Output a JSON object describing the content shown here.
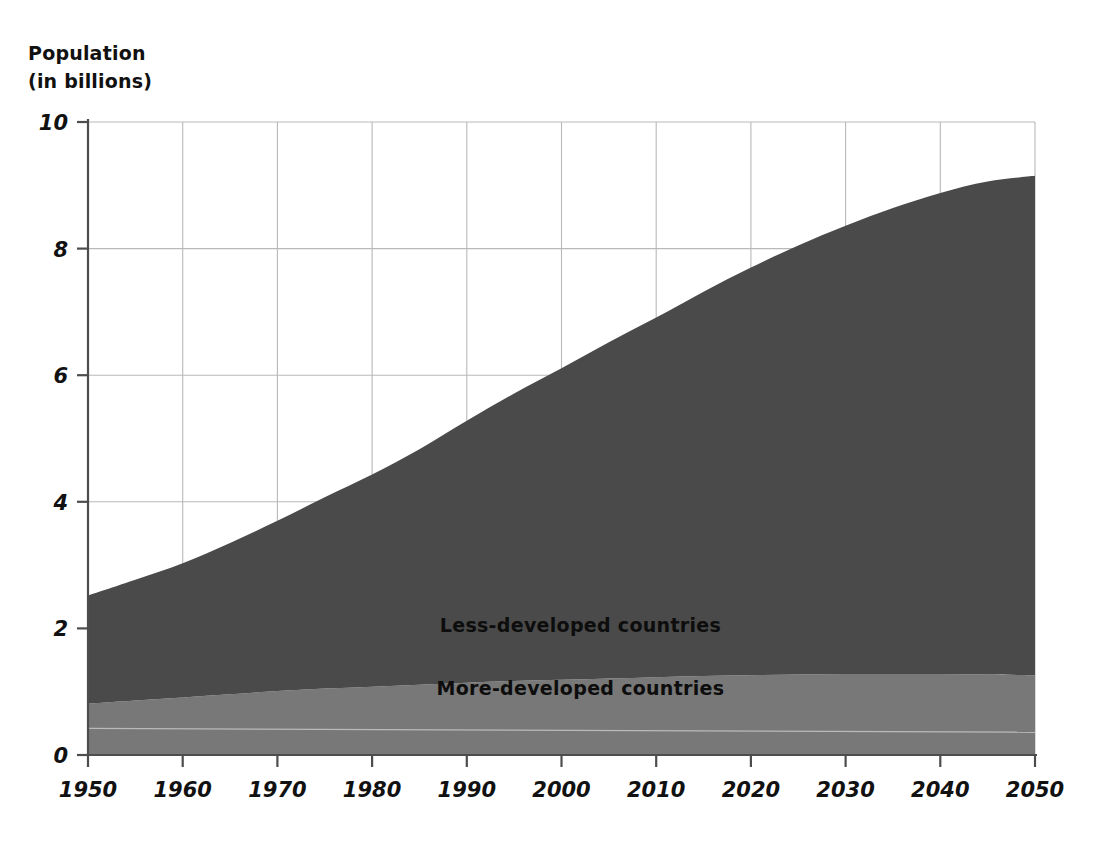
{
  "chart_data": {
    "type": "area",
    "title": "",
    "subtitle": "",
    "ylabel_line1": "Population",
    "ylabel_line2": "(in billions)",
    "xlabel": "",
    "stacked": true,
    "grid": true,
    "legend_position": "inline-on-areas",
    "xlim": [
      1950,
      2050
    ],
    "ylim": [
      0,
      10
    ],
    "yticks": [
      "0",
      "2",
      "4",
      "6",
      "8",
      "10"
    ],
    "ytick_values": [
      0,
      2,
      4,
      6,
      8,
      10
    ],
    "xticks": [
      "1950",
      "1960",
      "1970",
      "1980",
      "1990",
      "2000",
      "2010",
      "2020",
      "2030",
      "2040",
      "2050"
    ],
    "xtick_values": [
      1950,
      1960,
      1970,
      1980,
      1990,
      2000,
      2010,
      2020,
      2030,
      2040,
      2050
    ],
    "x": [
      1950,
      1955,
      1960,
      1965,
      1970,
      1975,
      1980,
      1985,
      1990,
      1995,
      2000,
      2005,
      2010,
      2015,
      2020,
      2025,
      2030,
      2035,
      2040,
      2045,
      2050
    ],
    "series": [
      {
        "name": "More-developed countries",
        "color": "#787878",
        "values": [
          0.81,
          0.86,
          0.91,
          0.96,
          1.01,
          1.05,
          1.08,
          1.11,
          1.14,
          1.17,
          1.19,
          1.21,
          1.23,
          1.25,
          1.26,
          1.27,
          1.28,
          1.28,
          1.28,
          1.27,
          1.26
        ]
      },
      {
        "name": "Less-developed countries",
        "color": "#4a4a4a",
        "values": [
          1.71,
          1.91,
          2.12,
          2.39,
          2.69,
          3.02,
          3.35,
          3.72,
          4.14,
          4.54,
          4.92,
          5.31,
          5.68,
          6.07,
          6.44,
          6.78,
          7.08,
          7.36,
          7.6,
          7.79,
          7.89
        ]
      }
    ],
    "totals": [
      2.52,
      2.77,
      3.03,
      3.35,
      3.7,
      4.07,
      4.43,
      4.83,
      5.28,
      5.71,
      6.11,
      6.52,
      6.91,
      7.32,
      7.7,
      8.05,
      8.36,
      8.64,
      8.88,
      9.06,
      9.15
    ],
    "annotations": [
      {
        "text": "Less-developed countries",
        "x": 2002,
        "y": 1.95
      },
      {
        "text": "More-developed countries",
        "x": 2002,
        "y": 0.95
      }
    ]
  },
  "colors": {
    "background": "#ffffff",
    "axis": "#4d4d4d",
    "grid": "#b9b9b9",
    "text": "#111111",
    "more_developed": "#787878",
    "less_developed": "#4a4a4a",
    "inner_gridline": "#c9c9c9"
  }
}
